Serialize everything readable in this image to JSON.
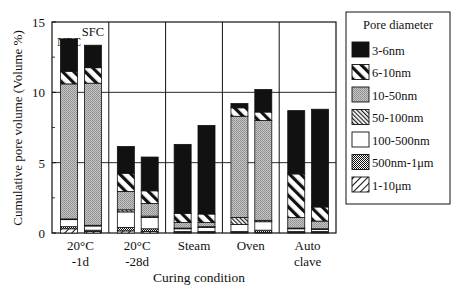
{
  "chart_data": {
    "type": "bar",
    "stacked": true,
    "title": "",
    "xlabel": "Curing condition",
    "ylabel": "Cumulative pore volume (Volume %)",
    "ylim": [
      0,
      15
    ],
    "yticks": [
      0,
      5,
      10,
      15
    ],
    "grid": "horizontal at 5 and 10; vertical separators between groups",
    "legend_title": "Pore diameter",
    "legend_position": "right",
    "groups": [
      {
        "label_line1": "20°C",
        "label_line2": "-1d"
      },
      {
        "label_line1": "20°C",
        "label_line2": "-28d"
      },
      {
        "label_line1": "Steam",
        "label_line2": ""
      },
      {
        "label_line1": "Oven",
        "label_line2": ""
      },
      {
        "label_line1": "Auto",
        "label_line2": "clave"
      }
    ],
    "bar_annotations": [
      {
        "group": 0,
        "bar": 0,
        "text": "NPC"
      },
      {
        "group": 0,
        "bar": 1,
        "text": "SFC"
      }
    ],
    "bars_per_group": [
      "NPC",
      "SFC"
    ],
    "series_order_bottom_to_top": [
      "1-10μm",
      "500nm-1μm",
      "100-500nm",
      "50-100nm",
      "10-50nm",
      "6-10nm",
      "3-6nm"
    ],
    "series": [
      {
        "name": "3-6nm",
        "pattern": "solid-black",
        "values": [
          2.3,
          1.6,
          1.9,
          2.4,
          4.9,
          6.3,
          0.3,
          1.6,
          4.5,
          6.95
        ]
      },
      {
        "name": "6-10nm",
        "pattern": "wide-hatch",
        "values": [
          0.9,
          1.1,
          1.3,
          0.9,
          0.65,
          0.6,
          0.6,
          0.6,
          3.1,
          1.0
        ]
      },
      {
        "name": "10-50nm",
        "pattern": "fine-gray",
        "values": [
          9.6,
          10.1,
          1.3,
          0.9,
          0.4,
          0.3,
          7.2,
          7.1,
          0.75,
          0.55
        ]
      },
      {
        "name": "50-100nm",
        "pattern": "fine-hatch",
        "values": [
          0.05,
          0.05,
          0.15,
          0.1,
          0.05,
          0.05,
          0.5,
          0.1,
          0.05,
          0.05
        ]
      },
      {
        "name": "100-500nm",
        "pattern": "white",
        "values": [
          0.5,
          0.3,
          1.1,
          0.8,
          0.2,
          0.3,
          0.5,
          0.6,
          0.2,
          0.15
        ]
      },
      {
        "name": "500nm-1μm",
        "pattern": "dense-dots",
        "values": [
          0.15,
          0.1,
          0.25,
          0.2,
          0.05,
          0.05,
          0.05,
          0.15,
          0.05,
          0.05
        ]
      },
      {
        "name": "1-10μm",
        "pattern": "back-diagonal",
        "values": [
          0.3,
          0.1,
          0.15,
          0.1,
          0.05,
          0.05,
          0.05,
          0.05,
          0.05,
          0.05
        ]
      }
    ],
    "bar_labels": [
      "20°C-1d NPC",
      "20°C-1d SFC",
      "20°C-28d NPC",
      "20°C-28d SFC",
      "Steam NPC",
      "Steam SFC",
      "Oven NPC",
      "Oven SFC",
      "Autoclave NPC",
      "Autoclave SFC"
    ],
    "totals": [
      13.0,
      13.7,
      6.3,
      5.5,
      6.4,
      7.7,
      9.7,
      10.6,
      8.8,
      8.85
    ]
  },
  "legend": {
    "title": "Pore diameter",
    "items": [
      {
        "label": "3-6nm",
        "pattern": "solid-black"
      },
      {
        "label": "6-10nm",
        "pattern": "wide-hatch"
      },
      {
        "label": "10-50nm",
        "pattern": "fine-gray"
      },
      {
        "label": "50-100nm",
        "pattern": "fine-hatch"
      },
      {
        "label": "100-500nm",
        "pattern": "white"
      },
      {
        "label": "500nm-1μm",
        "pattern": "dense-dots"
      },
      {
        "label": "1-10μm",
        "pattern": "back-diagonal"
      }
    ]
  }
}
